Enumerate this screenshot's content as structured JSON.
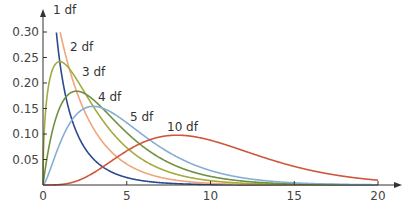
{
  "chart_data": {
    "type": "line",
    "title": "",
    "xlabel": "",
    "ylabel": "",
    "xlim": [
      0,
      20
    ],
    "ylim": [
      0,
      0.3
    ],
    "grid": false,
    "legend": "inline curve labels",
    "x_ticks": [
      0,
      5,
      10,
      15,
      20
    ],
    "x_tick_labels": [
      "0",
      "5",
      "10",
      "15",
      "20"
    ],
    "y_ticks": [
      0.05,
      0.1,
      0.15,
      0.2,
      0.25,
      0.3
    ],
    "y_tick_labels": [
      "0.05",
      "0.10",
      "0.15",
      "0.20",
      "0.25",
      "0.30"
    ],
    "series": [
      {
        "name": "1 df",
        "df": 1,
        "color": "#2c4a8c",
        "label_pos": [
          53,
          14
        ],
        "peak": {
          "x": 0,
          "y": "inf"
        }
      },
      {
        "name": "2 df",
        "df": 2,
        "color": "#f0a57a",
        "label_pos": [
          70,
          51
        ],
        "peak": {
          "x": 0,
          "y": 0.5
        }
      },
      {
        "name": "3 df",
        "df": 3,
        "color": "#a3ab3e",
        "label_pos": [
          82,
          76
        ],
        "peak": {
          "x": 1,
          "y": 0.242
        }
      },
      {
        "name": "4 df",
        "df": 4,
        "color": "#6f9140",
        "label_pos": [
          98,
          101
        ],
        "peak": {
          "x": 2,
          "y": 0.184
        }
      },
      {
        "name": "5 df",
        "df": 5,
        "color": "#86aed4",
        "label_pos": [
          130,
          121
        ],
        "peak": {
          "x": 3,
          "y": 0.154
        }
      },
      {
        "name": "10 df",
        "df": 10,
        "color": "#d0563a",
        "label_pos": [
          167,
          131
        ],
        "peak": {
          "x": 8,
          "y": 0.098
        }
      }
    ]
  },
  "axes": {
    "origin_label": "0"
  }
}
